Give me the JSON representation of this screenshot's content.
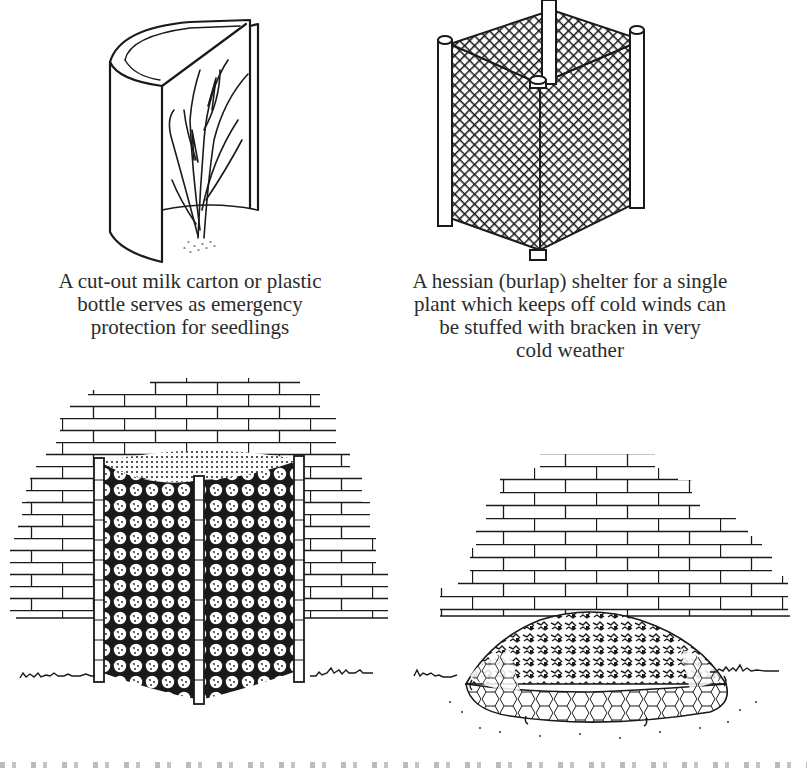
{
  "page": {
    "type": "scanned-book-illustration-page",
    "background": "#ffffff",
    "ink": "#1a1a1a"
  },
  "figures": [
    {
      "id": "milk-carton",
      "subject": "cut-out milk carton / plastic bottle around seedling",
      "caption_lines": [
        "A cut-out milk carton or plastic",
        "bottle serves as emergency",
        "protection for seedlings"
      ]
    },
    {
      "id": "hessian-shelter",
      "subject": "hessian (burlap) netting shelter on four posts around a central stake",
      "caption_lines": [
        "A hessian (burlap) shelter for a single",
        "plant which keeps off cold winds can",
        "be stuffed with bracken in very",
        "cold weather"
      ]
    },
    {
      "id": "wire-mesh-enclosure",
      "subject": "wire netting enclosure against a brick wall filled with leaves",
      "caption_lines": []
    },
    {
      "id": "mulch-mound",
      "subject": "mound of bracken held down by chicken wire pegged to the ground in front of a brick wall",
      "caption_lines": []
    }
  ]
}
